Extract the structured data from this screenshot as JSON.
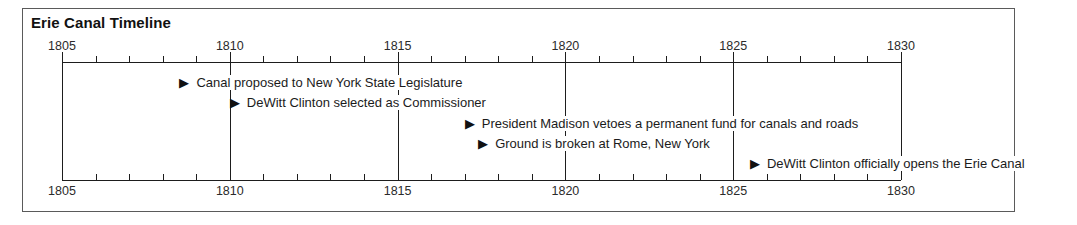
{
  "chart_data": {
    "type": "timeline",
    "title": "Erie Canal Timeline",
    "xlabel": "",
    "ylabel": "",
    "xlim": [
      1805,
      1830
    ],
    "axis": {
      "start": 1805,
      "end": 1830,
      "minor_tick_step": 1,
      "major_tick_step": 5,
      "tick_labels": [
        "1805",
        "1810",
        "1815",
        "1820",
        "1825",
        "1830"
      ],
      "tick_values": [
        1805,
        1810,
        1815,
        1820,
        1825,
        1830
      ],
      "top_axis_labels_position": "above",
      "bottom_axis_labels_position": "below",
      "grid": true,
      "gridline_years": [
        1805,
        1810,
        1815,
        1820,
        1825,
        1830
      ]
    },
    "marker_glyph": "▶",
    "events": [
      {
        "year": 1808.5,
        "label": "Canal proposed to New York State Legislature",
        "row": 1
      },
      {
        "year": 1810,
        "label": "DeWitt Clinton selected as Commissioner",
        "row": 2
      },
      {
        "year": 1817,
        "label": "President Madison vetoes a permanent fund for canals and roads",
        "row": 3
      },
      {
        "year": 1817.4,
        "label": "Ground is broken at Rome, New York",
        "row": 4
      },
      {
        "year": 1825.5,
        "label": "DeWitt Clinton officially opens the Erie Canal",
        "row": 5
      }
    ]
  },
  "colors": {
    "frame": "#5a5a5a",
    "axis": "#1d1d1d",
    "text": "#1b1b1b",
    "title": "#111111",
    "background": "#ffffff"
  }
}
